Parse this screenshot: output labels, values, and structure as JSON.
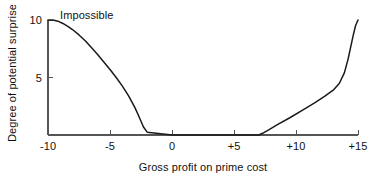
{
  "figure": {
    "background_color": "#ffffff",
    "line_color": "#1a1a1a",
    "axis_color": "#555555"
  },
  "chart_data": {
    "type": "line",
    "title": "",
    "subtitle": "",
    "xlabel": "Gross profit on prime cost",
    "ylabel": "Degree of potential surprise",
    "xlim": [
      -10,
      15
    ],
    "ylim": [
      0,
      10
    ],
    "grid": false,
    "legend": false,
    "legend_position": "none",
    "xticks": [
      -10,
      -5,
      0,
      5,
      10,
      15
    ],
    "xtick_labels": [
      "-10",
      "-5",
      "0",
      "+5",
      "+10",
      "+15"
    ],
    "yticks": [
      5,
      10
    ],
    "ytick_labels": [
      "5",
      "10"
    ],
    "annotations": [
      {
        "text": "Impossible",
        "x": -9.0,
        "y": 9.8
      }
    ],
    "series": [
      {
        "name": "Degree of potential surprise",
        "x": [
          -10.0,
          -9.6,
          -9.2,
          -8.8,
          -8.4,
          -8.0,
          -7.5,
          -7.0,
          -6.5,
          -6.0,
          -5.5,
          -5.0,
          -4.5,
          -4.0,
          -3.5,
          -3.0,
          -2.7,
          -2.5,
          -2.3,
          -2.0,
          0.0,
          2.5,
          5.0,
          6.5,
          7.0,
          7.3,
          7.8,
          8.5,
          9.5,
          10.5,
          11.5,
          12.3,
          13.0,
          13.5,
          13.9,
          14.2,
          14.4,
          14.6,
          14.8,
          15.0
        ],
        "y": [
          10.0,
          10.0,
          9.9,
          9.7,
          9.45,
          9.15,
          8.7,
          8.2,
          7.6,
          7.0,
          6.35,
          5.7,
          5.0,
          4.25,
          3.4,
          2.4,
          1.7,
          1.2,
          0.7,
          0.25,
          0.0,
          0.0,
          0.0,
          0.0,
          0.0,
          0.15,
          0.45,
          0.9,
          1.5,
          2.15,
          2.8,
          3.35,
          3.9,
          4.5,
          5.4,
          6.6,
          7.6,
          8.6,
          9.5,
          10.0
        ]
      }
    ]
  }
}
